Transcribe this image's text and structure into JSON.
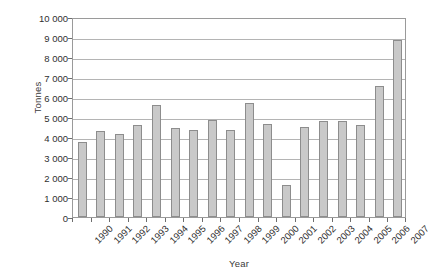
{
  "chart_data": {
    "type": "bar",
    "title": "",
    "xlabel": "Year",
    "ylabel": "Tonnes",
    "categories": [
      "1990",
      "1991",
      "1992",
      "1993",
      "1994",
      "1995",
      "1996",
      "1997",
      "1998",
      "1999",
      "2000",
      "2001",
      "2002",
      "2003",
      "2004",
      "2005",
      "2006",
      "2007"
    ],
    "values": [
      3750,
      4280,
      4130,
      4600,
      5580,
      4450,
      4340,
      4830,
      4350,
      5720,
      4670,
      1580,
      4480,
      4780,
      4810,
      4580,
      6550,
      8850
    ],
    "ylim": [
      0,
      10000
    ],
    "ytick_values": [
      0,
      1000,
      2000,
      3000,
      4000,
      5000,
      6000,
      7000,
      8000,
      9000,
      10000
    ],
    "ytick_labels": [
      "0",
      "1 000",
      "2 000",
      "3 000",
      "4 000",
      "5 000",
      "6 000",
      "7 000",
      "8 000",
      "9 000",
      "10 000"
    ],
    "grid": "horizontal",
    "legend": "none",
    "bar_color": "#c9c9c9",
    "bar_border_color": "#8d8d8d",
    "gridline_color": "#b4b4b4",
    "axis_color": "#9a9a9a",
    "text_color": "#2f2f2f"
  }
}
